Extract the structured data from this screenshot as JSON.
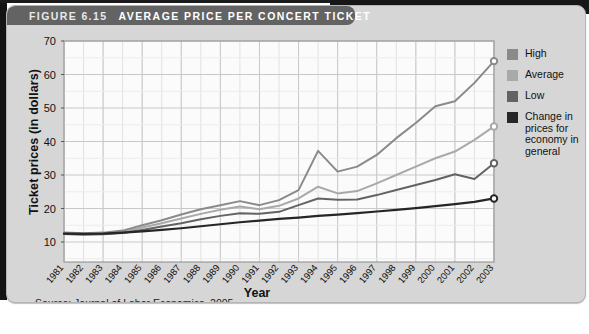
{
  "figure": {
    "label": "FIGURE 6.15",
    "title": "AVERAGE PRICE PER CONCERT TICKET",
    "source": "Source: Journal of Labor Economics, 2005."
  },
  "legend": {
    "items": [
      {
        "label": "High",
        "color": "#8a8a8a"
      },
      {
        "label": "Average",
        "color": "#a9a9a9"
      },
      {
        "label": "Low",
        "color": "#636363"
      },
      {
        "label": "Change in prices for economy in general",
        "color": "#262626"
      }
    ]
  },
  "chart_data": {
    "type": "line",
    "title": "AVERAGE PRICE PER CONCERT TICKET",
    "xlabel": "Year",
    "ylabel": "Ticket prices (in dollars)",
    "ylim": [
      5,
      70
    ],
    "yticks": [
      10,
      20,
      30,
      40,
      50,
      60,
      70
    ],
    "grid": true,
    "legend_position": "right",
    "categories": [
      "1981",
      "1982",
      "1983",
      "1984",
      "1985",
      "1986",
      "1987",
      "1988",
      "1989",
      "1990",
      "1991",
      "1992",
      "1993",
      "1994",
      "1995",
      "1996",
      "1997",
      "1998",
      "1999",
      "2000",
      "2001",
      "2002",
      "2003"
    ],
    "series": [
      {
        "name": "High",
        "color": "#8a8a8a",
        "values": [
          12.8,
          12.6,
          12.8,
          13.4,
          15.0,
          16.5,
          18.2,
          19.8,
          21.0,
          22.2,
          21.0,
          22.5,
          25.5,
          37.2,
          31.0,
          32.5,
          36.0,
          41.0,
          45.5,
          50.5,
          52.0,
          57.5,
          64.0
        ]
      },
      {
        "name": "Average",
        "color": "#a9a9a9",
        "values": [
          12.6,
          12.4,
          12.6,
          13.0,
          14.3,
          15.6,
          17.0,
          18.4,
          19.6,
          20.6,
          19.8,
          20.8,
          23.0,
          26.5,
          24.5,
          25.2,
          27.5,
          30.0,
          32.5,
          35.0,
          37.0,
          40.5,
          44.5
        ]
      },
      {
        "name": "Low",
        "color": "#636363",
        "values": [
          12.4,
          12.2,
          12.3,
          12.7,
          13.6,
          14.6,
          15.6,
          16.8,
          17.8,
          18.6,
          18.4,
          19.0,
          21.0,
          23.0,
          22.6,
          22.7,
          24.0,
          25.5,
          27.0,
          28.5,
          30.2,
          28.8,
          33.5
        ]
      },
      {
        "name": "Change in prices for economy in general",
        "color": "#262626",
        "values": [
          12.5,
          12.4,
          12.5,
          12.8,
          13.2,
          13.6,
          14.1,
          14.7,
          15.3,
          15.9,
          16.4,
          16.9,
          17.3,
          17.8,
          18.2,
          18.6,
          19.1,
          19.6,
          20.1,
          20.7,
          21.3,
          22.0,
          23.0
        ]
      }
    ]
  }
}
